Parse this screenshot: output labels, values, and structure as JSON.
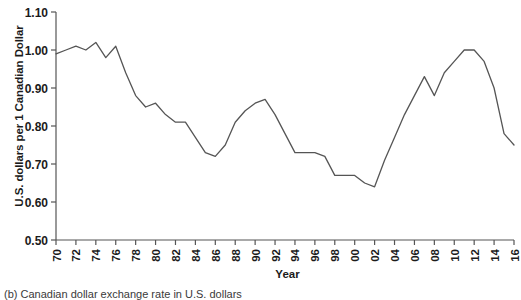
{
  "figure": {
    "caption": "(b) Canadian dollar exchange rate in U.S. dollars"
  },
  "chart_data": {
    "type": "line",
    "title": "",
    "xlabel": "Year",
    "ylabel": "U.S. dollars per 1 Canadian Dollar",
    "xlim": [
      1970,
      2016
    ],
    "ylim": [
      0.5,
      1.1
    ],
    "grid": false,
    "legend": null,
    "yticks": [
      "0.50",
      "0.60",
      "0.70",
      "0.80",
      "0.90",
      "1.00",
      "1.10"
    ],
    "ytick_values": [
      0.5,
      0.6,
      0.7,
      0.8,
      0.9,
      1.0,
      1.1
    ],
    "xticks": [
      "1970",
      "1972",
      "1974",
      "1976",
      "1978",
      "1980",
      "1982",
      "1984",
      "1986",
      "1988",
      "1990",
      "1992",
      "1994",
      "1996",
      "1998",
      "2000",
      "2002",
      "2004",
      "2006",
      "2008",
      "2010",
      "2012",
      "2014",
      "2016"
    ],
    "xtick_values": [
      1970,
      1972,
      1974,
      1976,
      1978,
      1980,
      1982,
      1984,
      1986,
      1988,
      1990,
      1992,
      1994,
      1996,
      1998,
      2000,
      2002,
      2004,
      2006,
      2008,
      2010,
      2012,
      2014,
      2016
    ],
    "series": [
      {
        "name": "Canadian dollar exchange rate",
        "color": "#555555",
        "x": [
          1970,
          1971,
          1972,
          1973,
          1974,
          1975,
          1976,
          1977,
          1978,
          1979,
          1980,
          1981,
          1982,
          1983,
          1984,
          1985,
          1986,
          1987,
          1988,
          1989,
          1990,
          1991,
          1992,
          1993,
          1994,
          1995,
          1996,
          1997,
          1998,
          1999,
          2000,
          2001,
          2002,
          2003,
          2004,
          2005,
          2006,
          2007,
          2008,
          2009,
          2010,
          2011,
          2012,
          2013,
          2014,
          2015,
          2016
        ],
        "values": [
          0.99,
          1.0,
          1.01,
          1.0,
          1.02,
          0.98,
          1.01,
          0.94,
          0.88,
          0.85,
          0.86,
          0.83,
          0.81,
          0.81,
          0.77,
          0.73,
          0.72,
          0.75,
          0.81,
          0.84,
          0.86,
          0.87,
          0.83,
          0.78,
          0.73,
          0.73,
          0.73,
          0.72,
          0.67,
          0.67,
          0.67,
          0.65,
          0.64,
          0.71,
          0.77,
          0.83,
          0.88,
          0.93,
          0.88,
          0.94,
          0.97,
          1.0,
          1.0,
          0.97,
          0.9,
          0.78,
          0.75
        ]
      }
    ]
  }
}
